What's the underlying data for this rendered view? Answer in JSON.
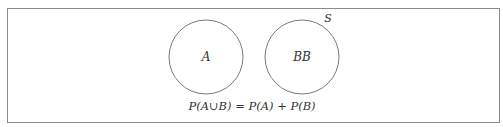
{
  "diagram": {
    "type": "venn",
    "sample_space": {
      "label": "S",
      "border_color": "#8a8a8a"
    },
    "sets": [
      {
        "label": "A",
        "cx": 206,
        "cy": 57,
        "r": 37
      },
      {
        "label": "BB",
        "cx": 302,
        "cy": 57,
        "r": 37
      }
    ],
    "circle_color": "#7a7a7a",
    "formula": "P(A∪B) = P(A) + P(B)"
  }
}
